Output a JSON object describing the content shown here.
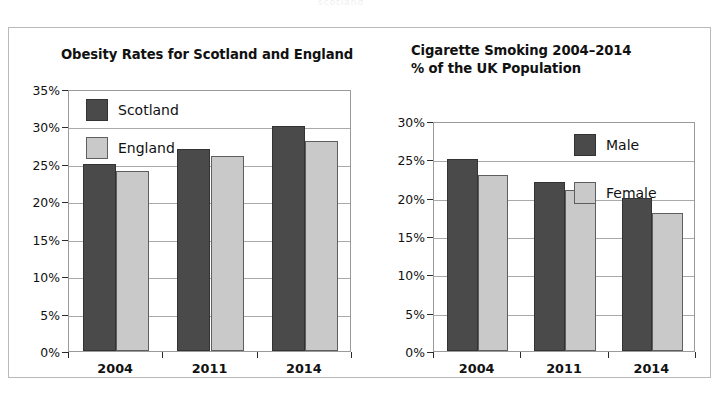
{
  "page": {
    "top_ghost_text": "scotland"
  },
  "chart_data": [
    {
      "type": "bar",
      "panel": "left",
      "title": "Obesity Rates for Scotland and England",
      "xlabel": "",
      "ylabel": "",
      "categories": [
        "2004",
        "2011",
        "2014"
      ],
      "ytick_labels": [
        "0%",
        "5%",
        "10%",
        "15%",
        "20%",
        "25%",
        "30%",
        "35%"
      ],
      "ytick_values": [
        0,
        5,
        10,
        15,
        20,
        25,
        30,
        35
      ],
      "ylim": [
        0,
        35
      ],
      "grid": true,
      "legend_position": "top-left-inside",
      "series": [
        {
          "name": "Scotland",
          "color": "#4a4a4a",
          "values": [
            25,
            27,
            30
          ]
        },
        {
          "name": "England",
          "color": "#c9c9c9",
          "values": [
            24,
            26,
            28
          ]
        }
      ]
    },
    {
      "type": "bar",
      "panel": "right",
      "title": "Cigarette Smoking 2004–2014\n% of the UK Population",
      "xlabel": "",
      "ylabel": "",
      "categories": [
        "2004",
        "2011",
        "2014"
      ],
      "ytick_labels": [
        "0%",
        "5%",
        "10%",
        "15%",
        "20%",
        "25%",
        "30%"
      ],
      "ytick_values": [
        0,
        5,
        10,
        15,
        20,
        25,
        30
      ],
      "ylim": [
        0,
        30
      ],
      "grid": true,
      "legend_position": "top-right-inside",
      "series": [
        {
          "name": "Male",
          "color": "#4a4a4a",
          "values": [
            25,
            22,
            20
          ]
        },
        {
          "name": "Female",
          "color": "#c9c9c9",
          "values": [
            23,
            21,
            18
          ]
        }
      ]
    }
  ]
}
